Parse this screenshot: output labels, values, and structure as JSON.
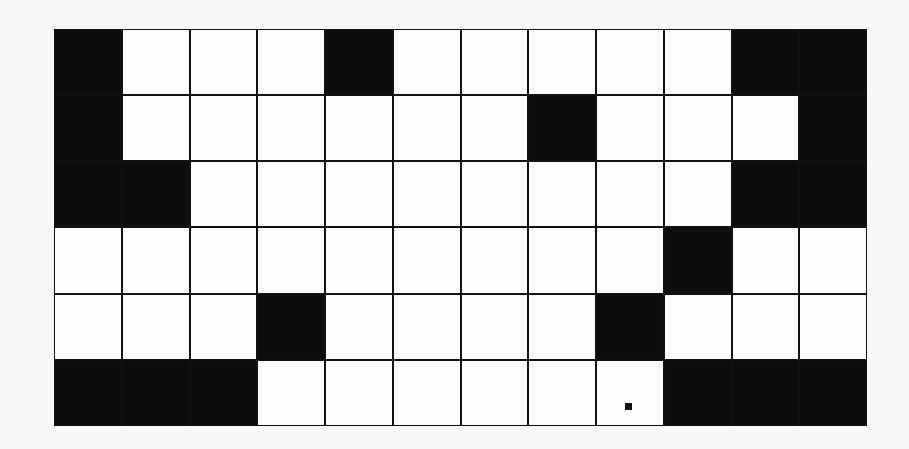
{
  "grid": {
    "rows": 6,
    "cols": 12,
    "colors": {
      "filled": "#0d0d0d",
      "empty": "#fdfdfd",
      "line": "#111111"
    },
    "cells": [
      [
        1,
        0,
        0,
        0,
        1,
        0,
        0,
        0,
        0,
        0,
        1,
        1
      ],
      [
        1,
        0,
        0,
        0,
        0,
        0,
        0,
        1,
        0,
        0,
        0,
        1
      ],
      [
        1,
        1,
        0,
        0,
        0,
        0,
        0,
        0,
        0,
        0,
        1,
        1
      ],
      [
        0,
        0,
        0,
        0,
        0,
        0,
        0,
        0,
        0,
        1,
        0,
        0
      ],
      [
        0,
        0,
        0,
        1,
        0,
        0,
        0,
        0,
        1,
        0,
        0,
        0
      ],
      [
        1,
        1,
        1,
        0,
        0,
        0,
        0,
        0,
        0,
        1,
        1,
        1
      ]
    ],
    "marker": {
      "row": 5,
      "col": 8,
      "label": "small-square"
    }
  }
}
